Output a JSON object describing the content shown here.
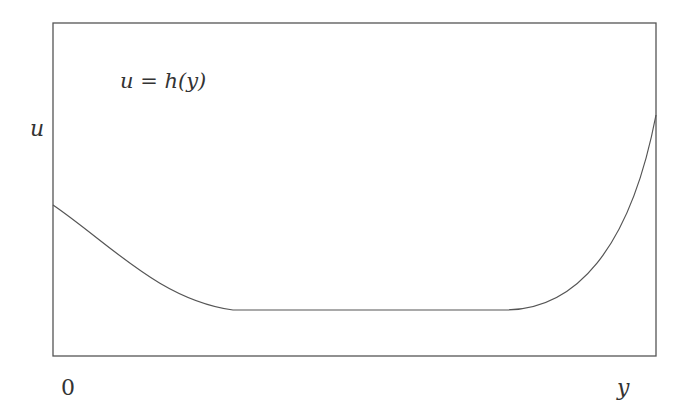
{
  "diagram": {
    "curve_label": "u = h(y)",
    "y_axis_label": "u",
    "x_axis_start_label": "0",
    "x_axis_end_label": "y",
    "colors": {
      "frame": "#555555",
      "curve": "#555555",
      "text": "#333333",
      "background": "#ffffff"
    },
    "frame": {
      "left": 53,
      "top": 23,
      "right": 656,
      "bottom": 356
    },
    "curve_description": "U-shaped curve: starts at mid-left height, decreases convexly to a flat minimum plateau, then rises steeply to the upper right edge",
    "curve_points_px": [
      [
        53,
        205
      ],
      [
        75,
        222
      ],
      [
        100,
        240
      ],
      [
        140,
        270
      ],
      [
        190,
        298
      ],
      [
        233,
        310
      ],
      [
        505,
        310
      ],
      [
        540,
        298
      ],
      [
        580,
        270
      ],
      [
        610,
        230
      ],
      [
        635,
        180
      ],
      [
        656,
        115
      ]
    ]
  }
}
